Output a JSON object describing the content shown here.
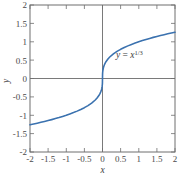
{
  "figure": {
    "background_color": "#ffffff",
    "box_color": "#6e6e6e",
    "axis_line_color": "#7a7a7a",
    "curve_color": "#3b72af",
    "annotation": {
      "base": "y = x",
      "y_symbol": "y",
      "equals": " = ",
      "x_symbol": "x",
      "exponent": "1/3",
      "full_text": "y = x^1/3"
    },
    "axis_titles": {
      "x": "x",
      "y": "y"
    }
  },
  "chart_data": {
    "type": "line",
    "title": "",
    "xlabel": "x",
    "ylabel": "y",
    "xlim": [
      -2,
      2
    ],
    "ylim": [
      -2,
      2
    ],
    "grid": false,
    "legend": "none",
    "annotations": [
      {
        "text": "y = x^1/3",
        "x": 1.0,
        "y": 0.72
      }
    ],
    "xticks": [
      -2,
      -1.5,
      -1,
      -0.5,
      0,
      0.5,
      1,
      1.5,
      2
    ],
    "xticklabels": [
      "-2",
      "-1.5",
      "-1",
      "-0.5",
      "0",
      "0.5",
      "1",
      "1.5",
      "2"
    ],
    "yticks": [
      -2,
      -1.5,
      -1,
      -0.5,
      0,
      0.5,
      1,
      1.5,
      2
    ],
    "yticklabels": [
      "-2",
      "-1.5",
      "-1",
      "-0.5",
      "0",
      "0.5",
      "1",
      "1.5",
      "2"
    ],
    "series": [
      {
        "name": "y = x^1/3",
        "color": "#3b72af",
        "linewidth": 1.6,
        "x": [
          -2,
          -1.9,
          -1.8,
          -1.7,
          -1.6,
          -1.5,
          -1.4,
          -1.3,
          -1.2,
          -1.1,
          -1,
          -0.9,
          -0.8,
          -0.7,
          -0.6,
          -0.5,
          -0.4,
          -0.3,
          -0.2,
          -0.15,
          -0.1,
          -0.07,
          -0.05,
          -0.03,
          -0.02,
          -0.01,
          -0.005,
          -0.002,
          0,
          0.002,
          0.005,
          0.01,
          0.02,
          0.03,
          0.05,
          0.07,
          0.1,
          0.15,
          0.2,
          0.3,
          0.4,
          0.5,
          0.6,
          0.7,
          0.8,
          0.9,
          1,
          1.1,
          1.2,
          1.3,
          1.4,
          1.5,
          1.6,
          1.7,
          1.8,
          1.9,
          2
        ],
        "y": [
          -1.26,
          -1.239,
          -1.216,
          -1.193,
          -1.17,
          -1.145,
          -1.119,
          -1.091,
          -1.063,
          -1.032,
          -1,
          -0.965,
          -0.928,
          -0.888,
          -0.843,
          -0.794,
          -0.737,
          -0.669,
          -0.585,
          -0.531,
          -0.464,
          -0.412,
          -0.368,
          -0.311,
          -0.271,
          -0.215,
          -0.171,
          -0.126,
          0,
          0.126,
          0.171,
          0.215,
          0.271,
          0.311,
          0.368,
          0.412,
          0.464,
          0.531,
          0.585,
          0.669,
          0.737,
          0.794,
          0.843,
          0.888,
          0.928,
          0.965,
          1,
          1.032,
          1.063,
          1.091,
          1.119,
          1.145,
          1.17,
          1.193,
          1.216,
          1.239,
          1.26
        ]
      }
    ]
  }
}
